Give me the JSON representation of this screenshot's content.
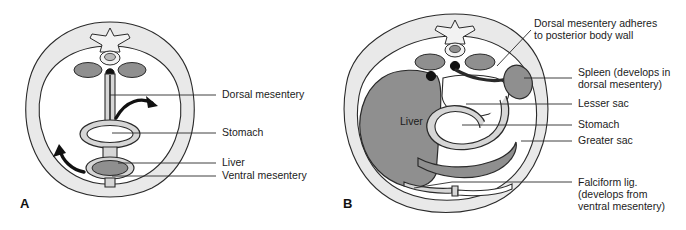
{
  "figure": {
    "background_color": "#ffffff",
    "panels": [
      {
        "letter": "A",
        "letter_position": {
          "x": 20,
          "y": 208
        },
        "description": "Early embryo cross-section showing stomach suspended by dorsal and ventral mesentery",
        "labels": [
          {
            "id": "dorsal-mesentery",
            "lines": [
              "Dorsal mesentery"
            ],
            "x": 222,
            "y": 98
          },
          {
            "id": "stomach",
            "lines": [
              "Stomach"
            ],
            "x": 222,
            "y": 136
          },
          {
            "id": "liver",
            "lines": [
              "Liver"
            ],
            "x": 222,
            "y": 166
          },
          {
            "id": "ventral-mesentery",
            "lines": [
              "Ventral mesentery"
            ],
            "x": 222,
            "y": 179
          }
        ],
        "rotation_arrows": [
          {
            "id": "arrow-upper-clockwise",
            "direction": "clockwise"
          },
          {
            "id": "arrow-lower-counterclockwise",
            "direction": "counterclockwise"
          }
        ]
      },
      {
        "letter": "B",
        "letter_position": {
          "x": 343,
          "y": 208
        },
        "description": "Later embryo cross-section after gut rotation showing lesser sac, greater sac, spleen and falciform ligament",
        "inline_labels": [
          {
            "id": "liver-inline",
            "text": "Liver",
            "x": 400,
            "y": 125
          }
        ],
        "labels": [
          {
            "id": "dorsal-mesentery-adheres",
            "lines": [
              "Dorsal mesentery adheres",
              "to posterior body wall"
            ],
            "x": 534,
            "y": 27
          },
          {
            "id": "spleen",
            "lines": [
              "Spleen (develops in",
              "dorsal mesentery)"
            ],
            "x": 578,
            "y": 76
          },
          {
            "id": "lesser-sac",
            "lines": [
              "Lesser sac"
            ],
            "x": 578,
            "y": 107
          },
          {
            "id": "stomach",
            "lines": [
              "Stomach"
            ],
            "x": 578,
            "y": 128
          },
          {
            "id": "greater-sac",
            "lines": [
              "Greater sac"
            ],
            "x": 578,
            "y": 144
          },
          {
            "id": "falciform-ligament",
            "lines": [
              "Falciform lig.",
              "(develops from",
              "ventral mesentery)"
            ],
            "x": 578,
            "y": 186
          }
        ]
      }
    ],
    "colors": {
      "body_wall_fill": "#e9e9e9",
      "cavity_fill": "#ffffff",
      "organ_dark_gray": "#8f8f8f",
      "organ_mid_gray": "#a8a8a8",
      "mesentery_fill": "#d6d6d6",
      "outline": "#2a2a2a",
      "label_text": "#1b1b1b",
      "leader_line": "#2a2a2a",
      "arrow_black": "#111111"
    }
  }
}
